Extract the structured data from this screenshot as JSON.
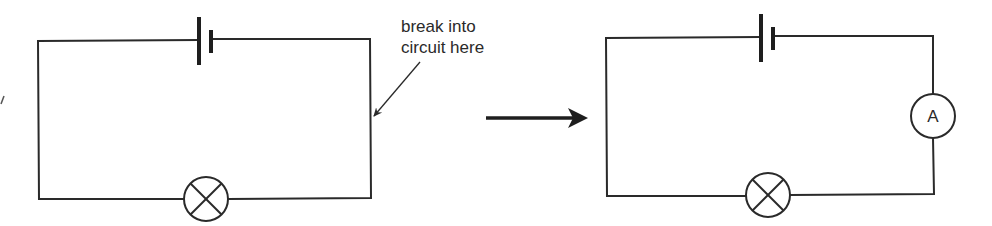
{
  "diagram": {
    "type": "circuit-transformation",
    "left_circuit": {
      "components": [
        "cell",
        "lamp"
      ],
      "annotation": {
        "line1": "break into",
        "line2": "circuit here"
      }
    },
    "transition_arrow": "right-arrow",
    "right_circuit": {
      "components": [
        "cell",
        "lamp",
        "ammeter"
      ],
      "ammeter_label": "A"
    },
    "colors": {
      "line": "#2a2a2a",
      "background": "#ffffff"
    }
  }
}
